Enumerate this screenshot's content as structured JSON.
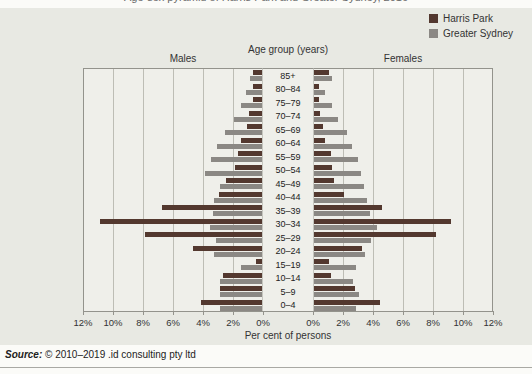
{
  "partial_title": "Age-sex pyramid of Harris Park and Greater Sydney, 2016",
  "legend": {
    "items": [
      {
        "label": "Harris Park",
        "color": "#53382f"
      },
      {
        "label": "Greater Sydney",
        "color": "#8b8884"
      }
    ]
  },
  "chart_data": {
    "type": "bar",
    "subtype": "population-pyramid",
    "title": "Age-sex pyramid of Harris Park and Greater Sydney, 2016",
    "left_label": "Males",
    "right_label": "Females",
    "center_axis_label": "Age group  (years)",
    "xlabel": "Per cent of persons",
    "xlim_percent": [
      0,
      12
    ],
    "grid": true,
    "legend_position": "top-right",
    "x_ticks_left": [
      "12%",
      "10%",
      "8%",
      "6%",
      "4%",
      "2%",
      "0%"
    ],
    "x_ticks_right": [
      "0%",
      "2%",
      "4%",
      "6%",
      "8%",
      "10%",
      "12%"
    ],
    "age_groups": [
      "85+",
      "80–84",
      "75–79",
      "70–74",
      "65–69",
      "60–64",
      "55–59",
      "50–54",
      "45–49",
      "40–44",
      "35–39",
      "30–34",
      "25–29",
      "20–24",
      "15–19",
      "10–14",
      "5–9",
      "0–4"
    ],
    "unit": "percent of persons",
    "series": [
      {
        "name": "Harris Park",
        "color": "#53382f",
        "males": [
          0.6,
          0.6,
          0.6,
          0.9,
          1.0,
          1.4,
          1.6,
          1.8,
          2.4,
          2.9,
          6.7,
          10.8,
          7.8,
          4.6,
          0.4,
          2.6,
          2.8,
          4.1
        ],
        "females": [
          1.0,
          0.3,
          0.3,
          0.4,
          0.6,
          0.7,
          1.1,
          1.2,
          1.3,
          2.0,
          4.5,
          9.1,
          8.1,
          3.2,
          1.0,
          1.1,
          2.7,
          4.4
        ]
      },
      {
        "name": "Greater Sydney",
        "color": "#8b8884",
        "males": [
          0.8,
          1.1,
          1.4,
          1.9,
          2.5,
          3.0,
          3.4,
          3.8,
          2.8,
          3.2,
          3.3,
          3.5,
          3.1,
          3.2,
          1.4,
          2.8,
          2.8,
          2.8
        ],
        "females": [
          1.2,
          0.7,
          1.2,
          1.6,
          2.2,
          2.5,
          2.9,
          3.1,
          3.3,
          3.5,
          3.7,
          4.2,
          3.8,
          3.4,
          2.8,
          2.6,
          3.0,
          2.8
        ]
      }
    ]
  },
  "source_note": {
    "prefix": "Source:",
    "text": " © 2010–2019 .id consulting pty ltd"
  }
}
